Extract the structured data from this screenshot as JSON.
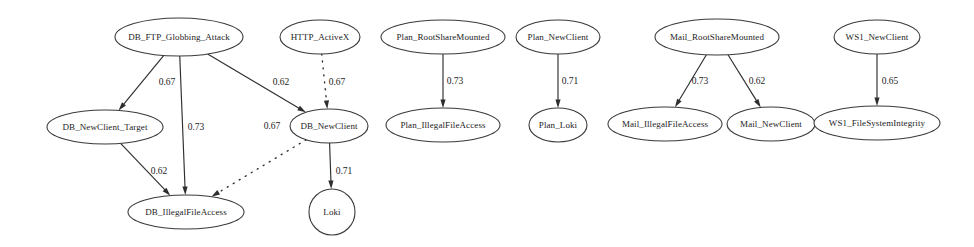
{
  "diagram": {
    "background_color": "#ffffff",
    "node_stroke_color": "#3a3a3a",
    "edge_color": "#2e2e2e",
    "text_color": "#1c1c1c"
  },
  "chart_data": {
    "type": "diagram",
    "layout": "directed-graph",
    "nodes": [
      {
        "id": "db_ftp_globbing_attack",
        "label": "DB_FTP_Globbing_Attack",
        "shape": "ellipse",
        "cx": 179,
        "cy": 37,
        "rx": 64,
        "ry": 19
      },
      {
        "id": "http_activex",
        "label": "HTTP_ActiveX",
        "shape": "ellipse",
        "cx": 320,
        "cy": 37,
        "rx": 40,
        "ry": 17
      },
      {
        "id": "plan_rootsharemounted",
        "label": "Plan_RootShareMounted",
        "shape": "ellipse",
        "cx": 443,
        "cy": 37,
        "rx": 62,
        "ry": 17
      },
      {
        "id": "plan_newclient",
        "label": "Plan_NewClient",
        "shape": "ellipse",
        "cx": 558,
        "cy": 37,
        "rx": 42,
        "ry": 17
      },
      {
        "id": "mail_rootsharemounted",
        "label": "Mail_RootShareMounted",
        "shape": "ellipse",
        "cx": 717,
        "cy": 37,
        "rx": 62,
        "ry": 18
      },
      {
        "id": "ws1_newclient",
        "label": "WS1_NewClient",
        "shape": "ellipse",
        "cx": 877,
        "cy": 37,
        "rx": 43,
        "ry": 17
      },
      {
        "id": "db_newclient_target",
        "label": "DB_NewClient_Target",
        "shape": "ellipse",
        "cx": 105,
        "cy": 127,
        "rx": 58,
        "ry": 17
      },
      {
        "id": "db_newclient",
        "label": "DB_NewClient",
        "shape": "ellipse",
        "cx": 329,
        "cy": 126,
        "rx": 39,
        "ry": 17
      },
      {
        "id": "plan_illegalfileaccess",
        "label": "Plan_IllegalFileAccess",
        "shape": "ellipse",
        "cx": 443,
        "cy": 125,
        "rx": 57,
        "ry": 17
      },
      {
        "id": "plan_loki",
        "label": "Plan_Loki",
        "shape": "ellipse",
        "cx": 558,
        "cy": 125,
        "rx": 29,
        "ry": 17
      },
      {
        "id": "mail_illegalfileaccess",
        "label": "Mail_IllegalFileAccess",
        "shape": "ellipse",
        "cx": 665,
        "cy": 124,
        "rx": 57,
        "ry": 17
      },
      {
        "id": "mail_newclient",
        "label": "Mail_NewClient",
        "shape": "ellipse",
        "cx": 771,
        "cy": 124,
        "rx": 44,
        "ry": 17
      },
      {
        "id": "ws1_filesystemintegrity",
        "label": "WS1_FileSystemIntegrity",
        "shape": "ellipse",
        "cx": 877,
        "cy": 123,
        "rx": 63,
        "ry": 17
      },
      {
        "id": "db_illegalfileaccess",
        "label": "DB_IllegalFileAccess",
        "shape": "ellipse",
        "cx": 186,
        "cy": 212,
        "rx": 58,
        "ry": 17
      },
      {
        "id": "loki",
        "label": "Loki",
        "shape": "circle",
        "cx": 332,
        "cy": 212,
        "rx": 23,
        "ry": 23
      }
    ],
    "edges": [
      {
        "from": "db_ftp_globbing_attack",
        "to": "db_newclient_target",
        "weight": "0.67",
        "style": "solid",
        "label_x": 167,
        "label_y": 83
      },
      {
        "from": "db_ftp_globbing_attack",
        "to": "db_illegalfileaccess",
        "weight": "0.73",
        "style": "solid",
        "label_x": 196,
        "label_y": 128
      },
      {
        "from": "db_ftp_globbing_attack",
        "to": "db_newclient",
        "weight": "0.62",
        "style": "solid",
        "label_x": 281,
        "label_y": 83
      },
      {
        "from": "http_activex",
        "to": "db_newclient",
        "weight": "0.67",
        "style": "dotted",
        "label_x": 337,
        "label_y": 83
      },
      {
        "from": "db_newclient",
        "to": "db_illegalfileaccess",
        "weight": "0.67",
        "style": "dotted",
        "label_x": 272,
        "label_y": 127
      },
      {
        "from": "db_newclient_target",
        "to": "db_illegalfileaccess",
        "weight": "0.62",
        "style": "solid",
        "label_x": 159,
        "label_y": 172
      },
      {
        "from": "db_newclient",
        "to": "loki",
        "weight": "0.71",
        "style": "solid",
        "label_x": 344,
        "label_y": 172
      },
      {
        "from": "plan_rootsharemounted",
        "to": "plan_illegalfileaccess",
        "weight": "0.73",
        "style": "solid",
        "label_x": 455,
        "label_y": 82
      },
      {
        "from": "plan_newclient",
        "to": "plan_loki",
        "weight": "0.71",
        "style": "solid",
        "label_x": 570,
        "label_y": 82
      },
      {
        "from": "mail_rootsharemounted",
        "to": "mail_illegalfileaccess",
        "weight": "0.73",
        "style": "solid",
        "label_x": 700,
        "label_y": 82
      },
      {
        "from": "mail_rootsharemounted",
        "to": "mail_newclient",
        "weight": "0.62",
        "style": "solid",
        "label_x": 757,
        "label_y": 82
      },
      {
        "from": "ws1_newclient",
        "to": "ws1_filesystemintegrity",
        "weight": "0.65",
        "style": "solid",
        "label_x": 890,
        "label_y": 82
      }
    ]
  }
}
